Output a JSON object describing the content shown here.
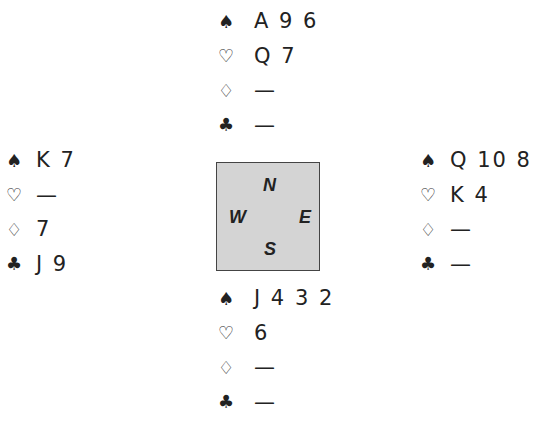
{
  "suits": {
    "spades": "♠",
    "hearts": "♡",
    "diamonds": "♢",
    "clubs": "♣"
  },
  "compass": {
    "north": "N",
    "west": "W",
    "east": "E",
    "south": "S",
    "background": "#d4d4d4"
  },
  "hands": {
    "north": {
      "spades": "A 9 6",
      "hearts": "Q 7",
      "diamonds": "—",
      "clubs": "—"
    },
    "west": {
      "spades": "K 7",
      "hearts": "—",
      "diamonds": "7",
      "clubs": "J 9"
    },
    "east": {
      "spades": "Q 10 8",
      "hearts": "K 4",
      "diamonds": "—",
      "clubs": "—"
    },
    "south": {
      "spades": "J 4 3 2",
      "hearts": "6",
      "diamonds": "—",
      "clubs": "—"
    }
  }
}
